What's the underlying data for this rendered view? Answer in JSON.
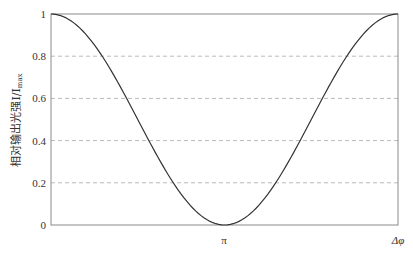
{
  "chart_data": {
    "type": "line",
    "title": "",
    "xlabel": "Δφ",
    "ylabel": "相对输出光强I/I",
    "ylabel_subscript": "max",
    "x_ticks": [
      "π"
    ],
    "x_axis_end_label": "Δφ",
    "y_ticks": [
      "0",
      "0.2",
      "0.4",
      "0.6",
      "0.8",
      "1"
    ],
    "ylim": [
      0,
      1
    ],
    "xlim": [
      0,
      6.2832
    ],
    "grid": "horizontal dashed",
    "series": [
      {
        "name": "I/Imax = cos²(Δφ/2)",
        "x": [
          0,
          0.3927,
          0.7854,
          1.1781,
          1.5708,
          1.9635,
          2.3562,
          2.7489,
          3.1416,
          3.5343,
          3.927,
          4.3197,
          4.7124,
          5.1051,
          5.4978,
          5.8905,
          6.2832
        ],
        "values": [
          1.0,
          0.962,
          0.854,
          0.691,
          0.5,
          0.309,
          0.146,
          0.038,
          0.0,
          0.038,
          0.146,
          0.309,
          0.5,
          0.691,
          0.854,
          0.962,
          1.0
        ]
      }
    ],
    "colors": {
      "line": "#333333",
      "axis": "#888888",
      "grid": "#bbbbbb"
    }
  }
}
